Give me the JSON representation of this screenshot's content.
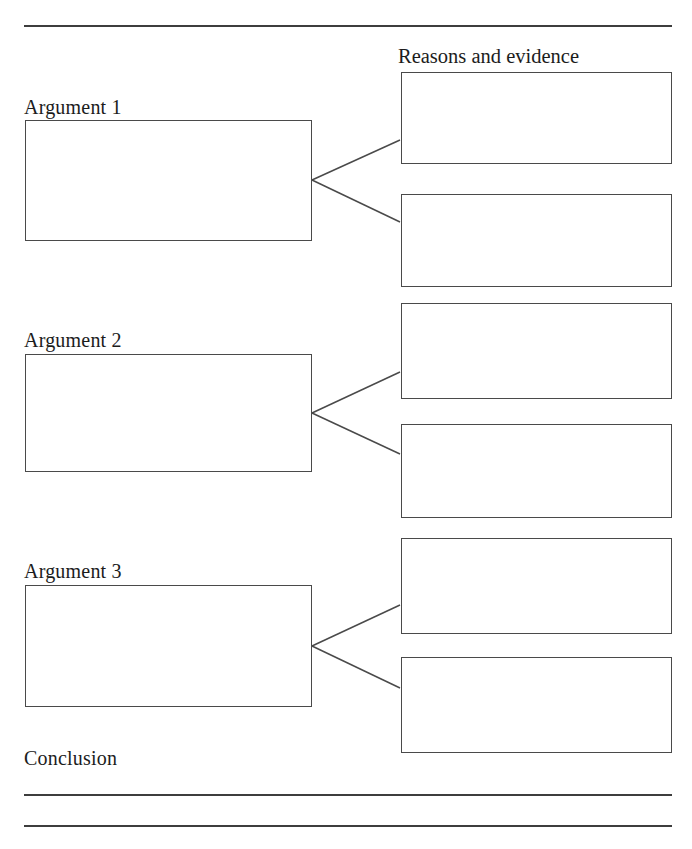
{
  "page": {
    "background_color": "#ffffff",
    "line_color": "#3d3d3d",
    "box_border_color": "#4a4a4a",
    "text_color": "#1c1c1c",
    "width": 692,
    "height": 849
  },
  "header": {
    "top_rule": {
      "x1": 24,
      "y1": 26,
      "x2": 672,
      "y2": 26
    }
  },
  "columns": {
    "reasons_header": "Reasons and evidence"
  },
  "arguments": [
    {
      "label": "Argument 1",
      "label_x": 24,
      "label_y": 97,
      "box": {
        "x": 25,
        "y": 120,
        "w": 287,
        "h": 121
      },
      "vertex": {
        "x": 312,
        "y": 180
      }
    },
    {
      "label": "Argument 2",
      "label_x": 24,
      "label_y": 330,
      "box": {
        "x": 25,
        "y": 354,
        "w": 287,
        "h": 118
      },
      "vertex": {
        "x": 312,
        "y": 413
      }
    },
    {
      "label": "Argument 3",
      "label_x": 24,
      "label_y": 561,
      "box": {
        "x": 25,
        "y": 585,
        "w": 287,
        "h": 122
      },
      "vertex": {
        "x": 312,
        "y": 646
      }
    }
  ],
  "evidence_boxes": [
    {
      "name": "evidence-box-1a",
      "x": 401,
      "y": 72,
      "w": 271,
      "h": 92
    },
    {
      "name": "evidence-box-1b",
      "x": 401,
      "y": 194,
      "w": 271,
      "h": 93
    },
    {
      "name": "evidence-box-2a",
      "x": 401,
      "y": 303,
      "w": 271,
      "h": 96
    },
    {
      "name": "evidence-box-2b",
      "x": 401,
      "y": 424,
      "w": 271,
      "h": 94
    },
    {
      "name": "evidence-box-3a",
      "x": 401,
      "y": 538,
      "w": 271,
      "h": 96
    },
    {
      "name": "evidence-box-3b",
      "x": 401,
      "y": 657,
      "w": 271,
      "h": 96
    }
  ],
  "connectors": [
    {
      "name": "connector-1-upper",
      "x1": 312,
      "y1": 180,
      "x2": 400,
      "y2": 140
    },
    {
      "name": "connector-1-lower",
      "x1": 312,
      "y1": 180,
      "x2": 400,
      "y2": 222
    },
    {
      "name": "connector-2-upper",
      "x1": 312,
      "y1": 413,
      "x2": 400,
      "y2": 372
    },
    {
      "name": "connector-2-lower",
      "x1": 312,
      "y1": 413,
      "x2": 400,
      "y2": 454
    },
    {
      "name": "connector-3-upper",
      "x1": 312,
      "y1": 646,
      "x2": 400,
      "y2": 605
    },
    {
      "name": "connector-3-lower",
      "x1": 312,
      "y1": 646,
      "x2": 400,
      "y2": 688
    }
  ],
  "conclusion": {
    "label": "Conclusion",
    "label_x": 24,
    "label_y": 748,
    "rules": [
      {
        "name": "conclusion-rule-1",
        "x1": 24,
        "y1": 795,
        "x2": 672,
        "y2": 795
      },
      {
        "name": "conclusion-rule-2",
        "x1": 24,
        "y1": 826,
        "x2": 672,
        "y2": 826
      }
    ]
  }
}
